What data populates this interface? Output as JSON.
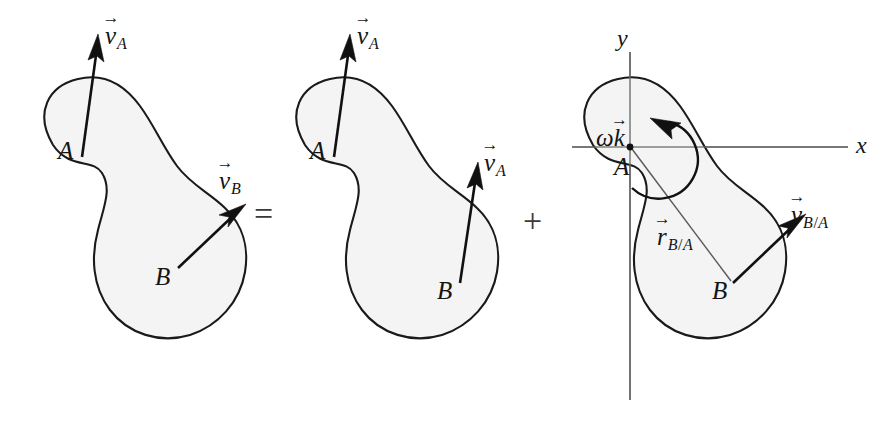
{
  "figure": {
    "background_color": "#ffffff",
    "body_fill_color": "#f4f4f4",
    "outline_color": "#1a1a1a",
    "vector_color": "#111111",
    "axis_color": "#6b6b6b"
  },
  "operators": {
    "equals": "=",
    "plus": "+"
  },
  "panels": [
    {
      "id": "total-motion",
      "points": [
        {
          "key": "A",
          "label": "A"
        },
        {
          "key": "B",
          "label": "B"
        }
      ],
      "vectors": [
        {
          "key": "vA",
          "base": "v",
          "accent": "→",
          "subscript": "A",
          "anchor_point": "A",
          "label_text": "vA"
        },
        {
          "key": "vB",
          "base": "v",
          "accent": "→",
          "subscript": "B",
          "anchor_point": "B",
          "label_text": "vB"
        }
      ]
    },
    {
      "id": "translation",
      "points": [
        {
          "key": "A",
          "label": "A"
        },
        {
          "key": "B",
          "label": "B"
        }
      ],
      "vectors": [
        {
          "key": "vA-at-A",
          "base": "v",
          "accent": "→",
          "subscript": "A",
          "anchor_point": "A",
          "label_text": "vA"
        },
        {
          "key": "vA-at-B",
          "base": "v",
          "accent": "→",
          "subscript": "A",
          "anchor_point": "B",
          "label_text": "vA"
        }
      ]
    },
    {
      "id": "rotation",
      "points": [
        {
          "key": "A",
          "label": "A"
        },
        {
          "key": "B",
          "label": "B"
        }
      ],
      "axes": {
        "x_label": "x",
        "y_label": "y"
      },
      "angular_velocity": {
        "base": "k",
        "accent": "→",
        "greek": "ω",
        "label_text": "ωk"
      },
      "vectors": [
        {
          "key": "rBA",
          "base": "r",
          "accent": "→",
          "subscript": "B/A",
          "anchor_point": "A",
          "label_text": "rB/A"
        },
        {
          "key": "vBA",
          "base": "v",
          "accent": "→",
          "subscript": "B/A",
          "anchor_point": "B",
          "label_text": "vB/A"
        }
      ],
      "rotation_arc": {
        "direction": "counterclockwise",
        "label": "rotation-arc"
      }
    }
  ],
  "subscript_parts": {
    "A": "A",
    "B": "B",
    "B_over_A": [
      "B",
      "/",
      "A"
    ]
  }
}
